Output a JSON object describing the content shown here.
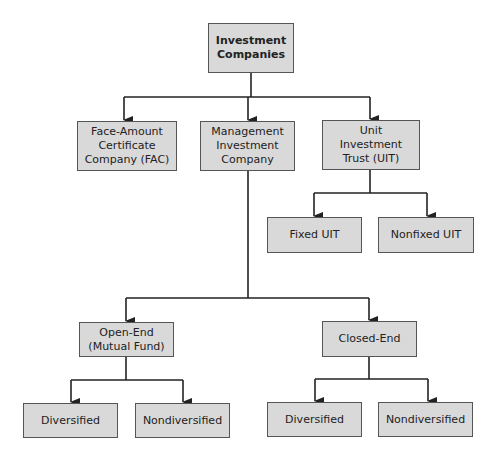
{
  "diagram": {
    "title": "Investment Companies",
    "colors": {
      "box_fill": "#d9d9d9",
      "box_border": "#555555",
      "line": "#222222",
      "text": "#222222"
    },
    "nodes": {
      "root": {
        "label": "Investment\nCompanies"
      },
      "fac": {
        "label": "Face-Amount\nCertificate\nCompany (FAC)"
      },
      "mic": {
        "label": "Management\nInvestment\nCompany"
      },
      "uit": {
        "label": "Unit\nInvestment\nTrust (UIT)"
      },
      "fixed_uit": {
        "label": "Fixed UIT"
      },
      "nonfixed_uit": {
        "label": "Nonfixed UIT"
      },
      "open_end": {
        "label": "Open-End\n(Mutual Fund)"
      },
      "closed_end": {
        "label": "Closed-End"
      },
      "open_div": {
        "label": "Diversified"
      },
      "open_nondiv": {
        "label": "Nondiversified"
      },
      "closed_div": {
        "label": "Diversified"
      },
      "closed_nondiv": {
        "label": "Nondiversified"
      }
    },
    "edges": [
      [
        "root",
        "fac"
      ],
      [
        "root",
        "mic"
      ],
      [
        "root",
        "uit"
      ],
      [
        "uit",
        "fixed_uit"
      ],
      [
        "uit",
        "nonfixed_uit"
      ],
      [
        "mic",
        "open_end"
      ],
      [
        "mic",
        "closed_end"
      ],
      [
        "open_end",
        "open_div"
      ],
      [
        "open_end",
        "open_nondiv"
      ],
      [
        "closed_end",
        "closed_div"
      ],
      [
        "closed_end",
        "closed_nondiv"
      ]
    ]
  }
}
